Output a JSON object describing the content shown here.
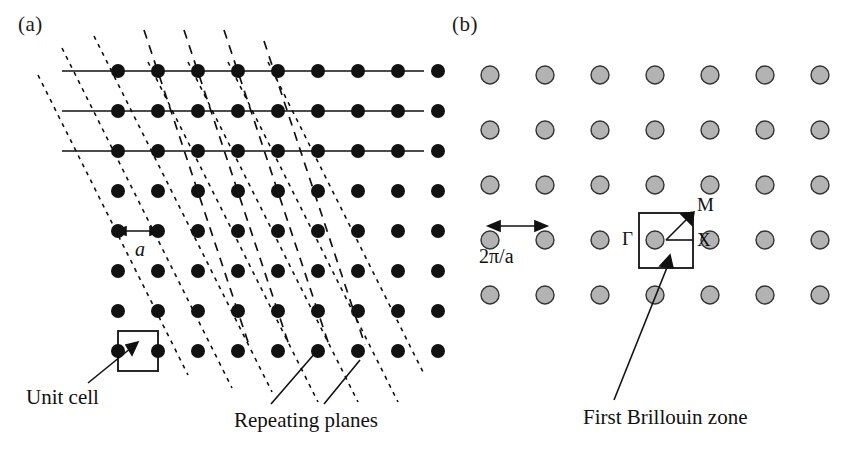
{
  "figure": {
    "type": "two-panel scientific diagram",
    "panels": [
      {
        "id": "a",
        "label": "(a)",
        "title": "Real-space square lattice with repeating planes",
        "captions": [
          "Unit cell",
          "Repeating planes"
        ],
        "measure_label": "a"
      },
      {
        "id": "b",
        "label": "(b)",
        "title": "Reciprocal lattice with first Brillouin zone",
        "captions": [
          "First Brillouin zone"
        ],
        "measure_label": "2π/a",
        "symmetry_points": [
          "Γ",
          "X",
          "M"
        ]
      }
    ]
  },
  "panel_a": {
    "label": "(a)",
    "unit_cell_caption": "Unit cell",
    "repeating_planes_caption": "Repeating planes",
    "lattice_constant_label": "a",
    "lattice": {
      "columns": 9,
      "rows": 8,
      "spacing_px": 40,
      "origin_x": 118,
      "origin_y": 71,
      "dot_radius_px": 7,
      "dot_color": "#111111"
    },
    "solid_rows": 3,
    "solid_line_color": "#111111",
    "dashed_planes": {
      "count": 4,
      "style": "long-dash",
      "color": "#111111"
    },
    "dotted_planes": {
      "count": 5,
      "style": "short-dash",
      "color": "#111111"
    },
    "unit_cell_square": {
      "x": 118,
      "y": 331,
      "size": 40
    }
  },
  "panel_b": {
    "label": "(b)",
    "brillouin_caption": "First Brillouin zone",
    "reciprocal_spacing_label": "2π/a",
    "symmetry_point_gamma": "Γ",
    "symmetry_point_x": "X",
    "symmetry_point_m": "M",
    "lattice": {
      "columns": 7,
      "rows": 5,
      "spacing_x_px": 55,
      "spacing_y_px": 55,
      "origin_x": 490,
      "origin_y": 75,
      "dot_radius_px": 9,
      "dot_fill": "#b3b3b3",
      "dot_stroke": "#333333"
    },
    "brillouin_zone": {
      "x": 639,
      "y": 213,
      "width": 54,
      "height": 55,
      "center_x": 666,
      "center_y": 240
    }
  },
  "colors": {
    "background": "#ffffff",
    "ink": "#111111",
    "reciprocal_dot_fill": "#b3b3b3",
    "reciprocal_dot_stroke": "#333333"
  }
}
